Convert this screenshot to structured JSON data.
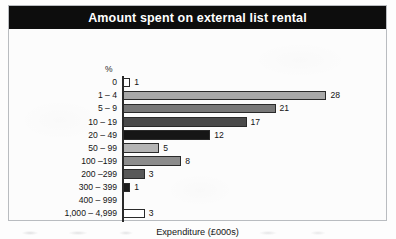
{
  "figure": {
    "title": "Amount spent on external list rental",
    "percent_axis_label": "%",
    "xaxis_title": "Expenditure (£000s)"
  },
  "chart_data": {
    "type": "bar",
    "orientation": "horizontal",
    "title": "Amount spent on external list rental",
    "xlabel": "Expenditure (£000s)",
    "ylabel": "%",
    "categories": [
      "0",
      "1 – 4",
      "5 – 9",
      "10 – 19",
      "20 – 49",
      "50 – 99",
      "100 –199",
      "200 –299",
      "300 – 399",
      "400 – 999",
      "1,000 – 4,999"
    ],
    "values": [
      1,
      28,
      21,
      17,
      12,
      5,
      8,
      3,
      1,
      0,
      3
    ],
    "value_labels": [
      "1",
      "28",
      "21",
      "17",
      "12",
      "5",
      "8",
      "3",
      "1",
      "",
      "3"
    ],
    "bar_colors": [
      "#ffffff",
      "#a8a8a8",
      "#787878",
      "#4a4a4a",
      "#161616",
      "#b4b4b4",
      "#8c8c8c",
      "#585858",
      "#1c1c1c",
      "#ffffff",
      "#ffffff"
    ],
    "bar_border_color": "#2a2a2a",
    "xlim": [
      0,
      30
    ],
    "grid": false,
    "legend": false,
    "title_banner_background": "#0d0d0d",
    "title_banner_text_color": "#ffffff"
  }
}
